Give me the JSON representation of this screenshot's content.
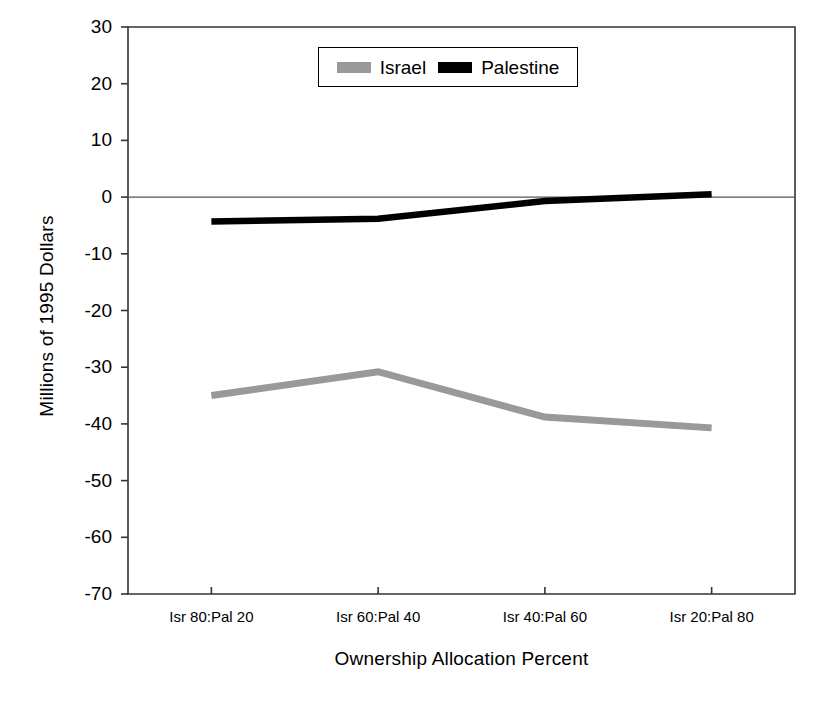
{
  "chart_data": {
    "type": "line",
    "title": "",
    "xlabel": "Ownership Allocation Percent",
    "ylabel": "Millions of 1995 Dollars",
    "categories": [
      "Isr 80:Pal 20",
      "Isr 60:Pal 40",
      "Isr 40:Pal 60",
      "Isr 20:Pal 80"
    ],
    "ylim": [
      -70,
      30
    ],
    "yticks": [
      30,
      20,
      10,
      0,
      -10,
      -20,
      -30,
      -40,
      -50,
      -60,
      -70
    ],
    "ytick_labels": [
      "30",
      "20",
      "10",
      "0",
      "-10",
      "-20",
      "-30",
      "-40",
      "-50",
      "-60",
      "-70"
    ],
    "grid": false,
    "legend_position": "top-center",
    "series": [
      {
        "name": "Israel",
        "color": "#999999",
        "values": [
          -35.0,
          -30.8,
          -38.8,
          -40.7
        ]
      },
      {
        "name": "Palestine",
        "color": "#000000",
        "values": [
          -4.3,
          -3.8,
          -0.7,
          0.5
        ]
      }
    ]
  },
  "legend": {
    "entries": [
      {
        "label": "Israel"
      },
      {
        "label": "Palestine"
      }
    ]
  }
}
